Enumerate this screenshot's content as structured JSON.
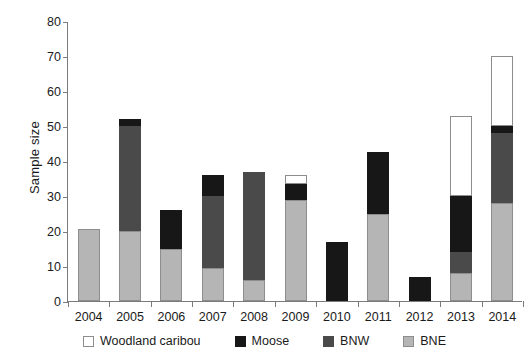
{
  "chart_data": {
    "type": "bar",
    "stacked": true,
    "title": "",
    "xlabel": "",
    "ylabel": "Sample size",
    "ylim": [
      0,
      80
    ],
    "yticks": [
      0,
      10,
      20,
      30,
      40,
      50,
      60,
      70,
      80
    ],
    "grid": false,
    "legend_position": "bottom",
    "categories": [
      "2004",
      "2005",
      "2006",
      "2007",
      "2008",
      "2009",
      "2010",
      "2011",
      "2012",
      "2013",
      "2014"
    ],
    "series": [
      {
        "name": "BNE",
        "color": "#b5b5b5",
        "values": [
          20.5,
          20,
          15,
          9.5,
          6,
          29,
          0,
          25,
          0,
          8,
          28
        ]
      },
      {
        "name": "BNW",
        "color": "#4a4a4a",
        "values": [
          0,
          30,
          0,
          20.5,
          31,
          0,
          0,
          0,
          0,
          6,
          20
        ]
      },
      {
        "name": "Moose",
        "color": "#171717",
        "values": [
          0,
          2,
          11,
          6,
          0,
          4.5,
          17,
          17.5,
          7,
          16,
          2
        ]
      },
      {
        "name": "Woodland caribou",
        "color": "#ffffff",
        "values": [
          0,
          0,
          0,
          0,
          0,
          2.5,
          0,
          0,
          0,
          23,
          20
        ]
      }
    ],
    "totals": [
      20.5,
      52,
      26,
      36,
      37,
      36,
      17,
      42.5,
      7,
      53,
      70
    ]
  },
  "axes": {
    "y_title": "Sample size",
    "y_tick_labels": [
      "0",
      "10",
      "20",
      "30",
      "40",
      "50",
      "60",
      "70",
      "80"
    ],
    "x_tick_labels": [
      "2004",
      "2005",
      "2006",
      "2007",
      "2008",
      "2009",
      "2010",
      "2011",
      "2012",
      "2013",
      "2014"
    ]
  },
  "legend": {
    "items": [
      {
        "label": "Woodland caribou",
        "key": "caribou"
      },
      {
        "label": "Moose",
        "key": "moose"
      },
      {
        "label": "BNW",
        "key": "bnw"
      },
      {
        "label": "BNE",
        "key": "bne"
      }
    ]
  }
}
